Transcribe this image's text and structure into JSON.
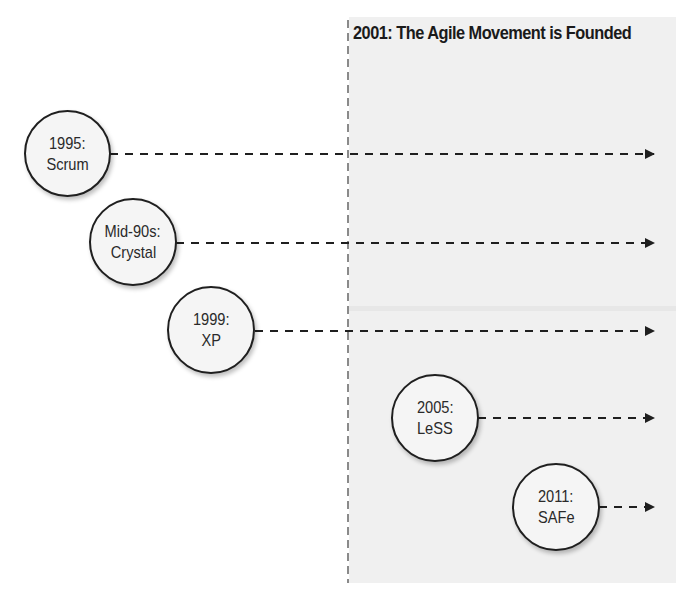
{
  "diagram": {
    "title": "2001: The Agile Movement is Founded",
    "divider_label": "",
    "colors": {
      "panel": "#f0f0f0",
      "stroke": "#1f1f1f",
      "node_fill": "#f5f5f5",
      "text": "#2a2a2a"
    },
    "nodes": [
      {
        "year": "1995:",
        "name": "Scrum"
      },
      {
        "year": "Mid-90s:",
        "name": "Crystal"
      },
      {
        "year": "1999:",
        "name": "XP"
      },
      {
        "year": "2005:",
        "name": "LeSS"
      },
      {
        "year": "2011:",
        "name": "SAFe"
      }
    ],
    "edges": [
      {
        "from": "Scrum",
        "style": "dashed-arrow",
        "to": "right"
      },
      {
        "from": "Crystal",
        "style": "dashed-arrow",
        "to": "right"
      },
      {
        "from": "XP",
        "style": "dashed-arrow",
        "to": "right"
      },
      {
        "from": "LeSS",
        "style": "dashed-arrow",
        "to": "right"
      },
      {
        "from": "SAFe",
        "style": "dashed-arrow",
        "to": "right"
      }
    ]
  }
}
